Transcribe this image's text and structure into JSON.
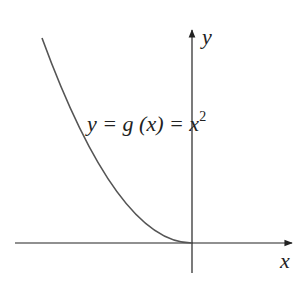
{
  "diagram": {
    "function_label": "y = g (x) = x",
    "function_exponent": "2",
    "x_axis_label": "x",
    "y_axis_label": "y",
    "curve": "parabola y = x^2 for x <= 0 (left half)",
    "colors": {
      "axes": "#222222",
      "curve": "#555555",
      "background": "#ffffff"
    }
  }
}
